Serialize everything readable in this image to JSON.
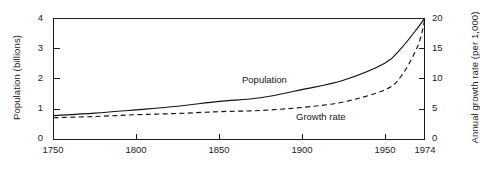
{
  "chart_data": {
    "type": "line",
    "title": "",
    "xlabel": "",
    "ylabel": "Population (billions)",
    "ylabel_right": "Annual growth rate (per 1,000)",
    "xlim": [
      1750,
      1974
    ],
    "ylim": [
      0,
      4
    ],
    "ylim_right": [
      0,
      20
    ],
    "grid": false,
    "legend_position": "inline-annotation",
    "x_ticks": [
      "1750",
      "1800",
      "1850",
      "1900",
      "1950",
      "1974"
    ],
    "x_tick_values": [
      1750,
      1800,
      1850,
      1900,
      1950,
      1974
    ],
    "y_ticks_left": [
      "0",
      "1",
      "2",
      "3",
      "4"
    ],
    "y_tick_values_left": [
      0,
      1,
      2,
      3,
      4
    ],
    "y_ticks_right": [
      "0",
      "5",
      "10",
      "15",
      "20"
    ],
    "y_tick_values_right": [
      0,
      5,
      10,
      15,
      20
    ],
    "x": [
      1750,
      1775,
      1800,
      1825,
      1850,
      1875,
      1900,
      1925,
      1950,
      1960,
      1970,
      1974
    ],
    "series": [
      {
        "name": "Population",
        "axis": "left",
        "units": "billions",
        "style": "solid",
        "color": "#111111",
        "values": [
          0.79,
          0.87,
          0.98,
          1.1,
          1.26,
          1.38,
          1.65,
          1.96,
          2.52,
          3.02,
          3.7,
          4.0
        ]
      },
      {
        "name": "Growth rate",
        "axis": "right",
        "units": "per 1,000",
        "style": "dashed",
        "color": "#111111",
        "values": [
          3.6,
          3.8,
          4.1,
          4.3,
          4.6,
          4.8,
          5.3,
          6.2,
          8.2,
          10.5,
          15.5,
          19.6
        ]
      }
    ],
    "annotations": [
      {
        "text": "Population",
        "x": 1885,
        "y": 2.1
      },
      {
        "text": "Growth rate",
        "x": 1915,
        "y": 0.85
      }
    ]
  },
  "axes": {
    "left_title": "Population (billions)",
    "right_title": "Annual growth rate (per 1,000)"
  },
  "labels": {
    "population": "Population",
    "growth_rate": "Growth rate"
  },
  "caption": {
    "text": ""
  },
  "colors": {
    "ink": "#1a1a1a",
    "background": "#ffffff",
    "curve": "#111111"
  }
}
